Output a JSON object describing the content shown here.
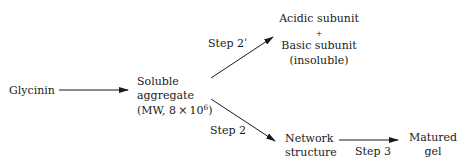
{
  "diagram": {
    "type": "reaction-pathway",
    "nodes": {
      "glycinin": {
        "label": "Glycinin"
      },
      "soluble_aggregate": {
        "line1": "Soluble",
        "line2": "aggregate",
        "line3_prefix": "(MW, 8 × 10",
        "line3_sup": "6",
        "line3_suffix": ")"
      },
      "subunits": {
        "line1": "Acidic subunit",
        "line2": "+",
        "line3": "Basic subunit",
        "line4": "(insoluble)"
      },
      "network": {
        "line1": "Network",
        "line2": "structure"
      },
      "matured_gel": {
        "line1": "Matured",
        "line2": "gel"
      }
    },
    "edges": [
      {
        "from": "Glycinin",
        "to": "Soluble aggregate",
        "label": ""
      },
      {
        "from": "Soluble aggregate",
        "to": "Acidic subunit + Basic subunit (insoluble)",
        "label": "Step 2'"
      },
      {
        "from": "Soluble aggregate",
        "to": "Network structure",
        "label": "Step 2"
      },
      {
        "from": "Network structure",
        "to": "Matured gel",
        "label": "Step 3"
      }
    ],
    "labels": {
      "step2prime": "Step 2ˈ",
      "step2": "Step 2",
      "step3": "Step 3"
    }
  }
}
